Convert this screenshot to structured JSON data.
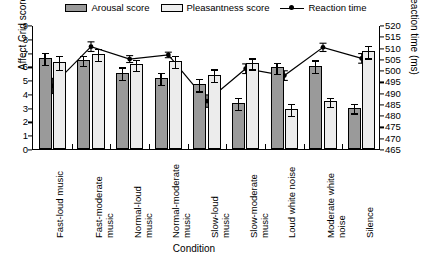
{
  "legend": {
    "items": [
      {
        "name": "arousal",
        "label": "Arousal score",
        "swatch": "dark-gray-bar",
        "color": "#9a9a9a"
      },
      {
        "name": "pleasantness",
        "label": "Pleasantness score",
        "swatch": "light-gray-bar",
        "color": "#ececec"
      },
      {
        "name": "reaction_time",
        "label": "Reaction time",
        "swatch": "line-with-dot-marker",
        "color": "#000000"
      }
    ]
  },
  "axes": {
    "left": {
      "label": "Affect Grid score",
      "min": 0,
      "max": 9,
      "step": 1,
      "ticks": [
        "0",
        "1",
        "2",
        "3",
        "4",
        "5",
        "6",
        "7",
        "8",
        "9"
      ]
    },
    "right": {
      "label": "Reaction time (ms)",
      "min": 465,
      "max": 520,
      "step": 5,
      "ticks": [
        "465",
        "470",
        "475",
        "480",
        "485",
        "490",
        "495",
        "500",
        "505",
        "510",
        "515",
        "520"
      ]
    },
    "x": {
      "label": "Condition"
    }
  },
  "chart_data": {
    "type": "bar",
    "title": "",
    "xlabel": "Condition",
    "ylabel": "Affect Grid score",
    "y2label": "Reaction time (ms)",
    "ylim": [
      0,
      9
    ],
    "y2lim": [
      465,
      520
    ],
    "grid": false,
    "legend_position": "top-center",
    "categories": [
      "Fast-loud music",
      "Fast-moderate music",
      "Normal-loud music",
      "Normal-moderate music",
      "Slow-loud music",
      "Slow-moderate music",
      "Loud white noise",
      "Moderate white noise",
      "Silence"
    ],
    "series": [
      {
        "name": "Arousal score",
        "type": "bar",
        "axis": "left",
        "values": [
          6.6,
          6.45,
          5.55,
          5.15,
          4.7,
          3.35,
          5.95,
          6.05,
          3.0
        ],
        "errors": [
          0.45,
          0.35,
          0.45,
          0.45,
          0.45,
          0.45,
          0.4,
          0.45,
          0.35
        ]
      },
      {
        "name": "Pleasantness score",
        "type": "bar",
        "axis": "left",
        "values": [
          6.3,
          6.9,
          6.15,
          6.4,
          5.4,
          6.25,
          2.9,
          3.45,
          7.1
        ],
        "errors": [
          0.5,
          0.45,
          0.4,
          0.45,
          0.45,
          0.4,
          0.45,
          0.35,
          0.45
        ]
      },
      {
        "name": "Reaction time",
        "type": "line",
        "axis": "right",
        "values_left_scale": [
          4.65,
          7.5,
          6.6,
          6.9,
          3.55,
          5.9,
          5.4,
          7.45,
          6.65
        ],
        "values": [
          493.4,
          510.8,
          505.3,
          507.2,
          486.7,
          501.1,
          498.0,
          510.5,
          505.6
        ],
        "errors_left_scale": [
          0.55,
          0.35,
          0.25,
          0.2,
          0.45,
          0.35,
          0.35,
          0.3,
          0.35
        ]
      }
    ]
  }
}
